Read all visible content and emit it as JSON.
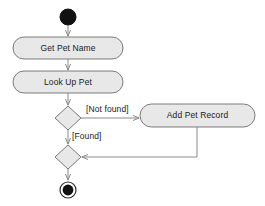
{
  "diagram": {
    "type": "uml-activity-diagram",
    "colors": {
      "node_fill": "#e8e8e8",
      "node_stroke": "#7a7a7a",
      "edge_stroke": "#8a8a8a",
      "text": "#1a1a1a",
      "terminal_fill": "#000000",
      "background": "#ffffff"
    },
    "nodes": [
      {
        "id": "initial",
        "kind": "initial-node",
        "label": "",
        "cx": 68,
        "cy": 17,
        "r": 8
      },
      {
        "id": "get-pet-name",
        "kind": "action",
        "label": "Get Pet Name",
        "x": 13,
        "y": 37,
        "w": 110,
        "h": 22
      },
      {
        "id": "look-up-pet",
        "kind": "action",
        "label": "Look Up Pet",
        "x": 13,
        "y": 71,
        "w": 110,
        "h": 22
      },
      {
        "id": "decision",
        "kind": "decision-node",
        "label": "",
        "cx": 68,
        "cy": 118,
        "rx": 13,
        "ry": 12
      },
      {
        "id": "add-pet-record",
        "kind": "action",
        "label": "Add Pet Record",
        "x": 140,
        "y": 104,
        "w": 115,
        "h": 23
      },
      {
        "id": "merge",
        "kind": "merge-node",
        "label": "",
        "cx": 68,
        "cy": 157,
        "rx": 13,
        "ry": 12
      },
      {
        "id": "final",
        "kind": "final-node",
        "label": "",
        "cx": 68,
        "cy": 190,
        "r_outer": 8,
        "r_inner": 5.5
      }
    ],
    "edges": [
      {
        "id": "e1",
        "from": "initial",
        "to": "get-pet-name",
        "guard": ""
      },
      {
        "id": "e2",
        "from": "get-pet-name",
        "to": "look-up-pet",
        "guard": ""
      },
      {
        "id": "e3",
        "from": "look-up-pet",
        "to": "decision",
        "guard": ""
      },
      {
        "id": "e4",
        "from": "decision",
        "to": "add-pet-record",
        "guard": "[Not found]"
      },
      {
        "id": "e5",
        "from": "decision",
        "to": "merge",
        "guard": "[Found]"
      },
      {
        "id": "e6",
        "from": "add-pet-record",
        "to": "merge",
        "guard": ""
      },
      {
        "id": "e7",
        "from": "merge",
        "to": "final",
        "guard": ""
      }
    ],
    "guards": {
      "not_found": "[Not found]",
      "found": "[Found]"
    },
    "labels": {
      "get_pet_name": "Get Pet Name",
      "look_up_pet": "Look Up Pet",
      "add_pet_record": "Add Pet Record"
    }
  }
}
